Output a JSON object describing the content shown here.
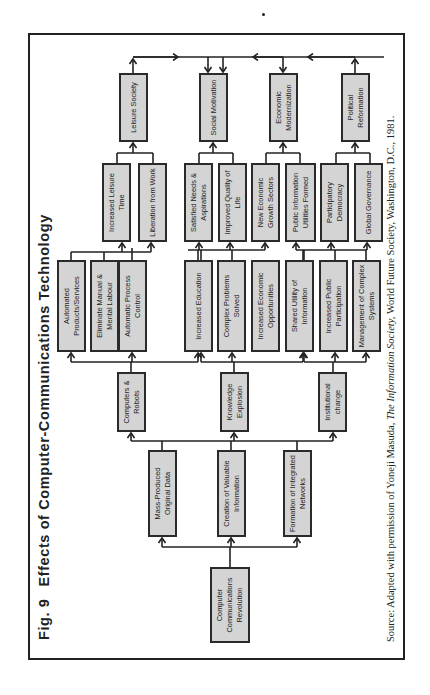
{
  "figure": {
    "number": "Fig. 9",
    "title": "Effects of Computer-Communications Technology",
    "source_prefix": "Source: Adapted with permission of Yoneji Masuda, ",
    "source_italic": "The Information Society,",
    "source_suffix": " World Future Society, Washington, D.C., 1981."
  },
  "colors": {
    "box_fill": "#d4d4d4",
    "line": "#222222",
    "background": "#ffffff"
  },
  "tiers": [
    {
      "name": "origin",
      "boxes": [
        {
          "id": "ccr",
          "label": "Computer Communications Revolution"
        }
      ]
    },
    {
      "name": "tier1",
      "boxes": [
        {
          "id": "mpod",
          "label": "Mass-Produced Original Data"
        },
        {
          "id": "cvi",
          "label": "Creation of Valuable Information"
        },
        {
          "id": "fin",
          "label": "Formation of Integrated Networks"
        }
      ]
    },
    {
      "name": "tier2",
      "boxes": [
        {
          "id": "cr",
          "label": "Computers & Robots"
        },
        {
          "id": "ke",
          "label": "Knowledge Explosion"
        },
        {
          "id": "ic",
          "label": "Institutional change"
        }
      ]
    },
    {
      "name": "tier3",
      "boxes": [
        {
          "id": "aps",
          "label": "Automated Products/Services"
        },
        {
          "id": "emml",
          "label": "Eliminate Manual & Mental Labour"
        },
        {
          "id": "apc",
          "label": "Automatic Process Control"
        },
        {
          "id": "ie",
          "label": "Increased Education"
        },
        {
          "id": "cps",
          "label": "Complex Problems Solved"
        },
        {
          "id": "ieo",
          "label": "Increased Economic Opportunities"
        },
        {
          "id": "sui",
          "label": "Shared Utility of Information"
        },
        {
          "id": "ipp",
          "label": "Increased Public Participation"
        },
        {
          "id": "mcs",
          "label": "Management of Complex Systems"
        }
      ]
    },
    {
      "name": "tier4",
      "boxes": [
        {
          "id": "ilt",
          "label": "Increased Leisure Time"
        },
        {
          "id": "lfw",
          "label": "Liberation from Work"
        },
        {
          "id": "sna",
          "label": "Satisfied Needs & Aspirations"
        },
        {
          "id": "iql",
          "label": "Improved Quality of Life"
        },
        {
          "id": "negs",
          "label": "New Economic Growth Sectors"
        },
        {
          "id": "piuf",
          "label": "Public Information Utilities Formed"
        },
        {
          "id": "pd",
          "label": "Participatory Democracy"
        },
        {
          "id": "gg",
          "label": "Global Governance"
        }
      ]
    },
    {
      "name": "tier5",
      "boxes": [
        {
          "id": "ls",
          "label": "Leisure Society"
        },
        {
          "id": "sm",
          "label": "Social Motivation"
        },
        {
          "id": "em",
          "label": "Economic Modernization"
        },
        {
          "id": "pr",
          "label": "Political Reformation"
        }
      ]
    }
  ]
}
